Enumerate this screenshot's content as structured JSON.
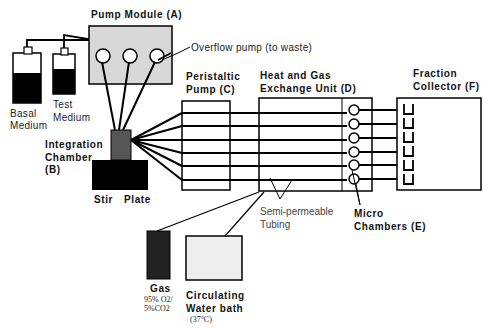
{
  "components": {
    "pump_module": {
      "label": "Pump Module (A)",
      "fill": "#d8d8d8"
    },
    "overflow_pump": {
      "label": "Overflow pump (to waste)"
    },
    "basal_medium": {
      "line1": "Basal",
      "line2": "Medium"
    },
    "test_medium": {
      "line1": "Test",
      "line2": "Medium"
    },
    "integration_chamber": {
      "line1": "Integration",
      "line2": "Chamber",
      "line3": "(B)",
      "fill": "#555555"
    },
    "stir_plate": {
      "line1": "Stir",
      "line2": "Plate"
    },
    "peristaltic_pump": {
      "line1": "Peristaltic",
      "line2": "Pump (C)"
    },
    "heat_gas_unit": {
      "line1": "Heat and Gas",
      "line2": "Exchange Unit (D)"
    },
    "fraction_collector": {
      "line1": "Fraction",
      "line2": "Collector (F)"
    },
    "semi_permeable": {
      "line1": "Semi-permeable",
      "line2": "Tubing"
    },
    "micro_chambers": {
      "line1": "Micro",
      "line2": "Chambers (E)"
    },
    "gas": {
      "line1": "Gas",
      "line2": "95% O2/",
      "line3": "5%CO2",
      "fill": "#222222"
    },
    "water_bath": {
      "line1": "Circulating",
      "line2": "Water bath",
      "line3": "(37°C)",
      "fill": "#eeeeee"
    }
  },
  "channel_count": 6
}
